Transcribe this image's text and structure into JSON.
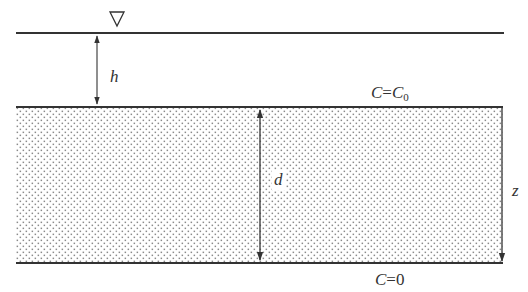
{
  "diagram": {
    "type": "sediment-layer-schematic",
    "water_surface_symbol": "∇",
    "labels": {
      "h": "h",
      "d": "d",
      "z": "z",
      "top_boundary_var": "C",
      "top_boundary_eq": "=",
      "top_boundary_value": "C",
      "top_boundary_value_sub": "0",
      "bottom_boundary_var": "C",
      "bottom_boundary_eq": "=0"
    },
    "colors": {
      "line": "#333333",
      "dots": "#888888",
      "background": "#ffffff"
    }
  }
}
